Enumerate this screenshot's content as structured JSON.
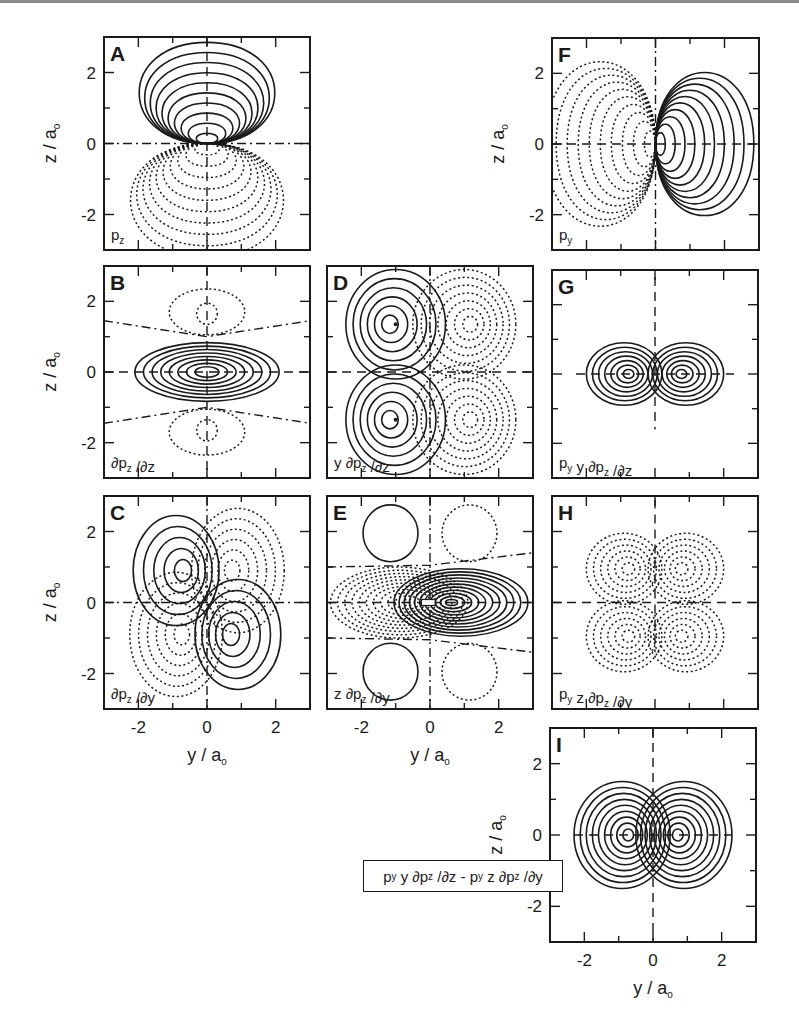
{
  "figure": {
    "axis": {
      "x_title": "y / a",
      "x_title_sub": "o",
      "y_title": "z / a",
      "y_title_sub": "o",
      "x_ticks": [
        "-2",
        "0",
        "2"
      ],
      "y_ticks": [
        "2",
        "0",
        "-2"
      ]
    },
    "panels": [
      {
        "id": "A",
        "label": "A",
        "func": "p",
        "func_sub": "z",
        "func_rest": ""
      },
      {
        "id": "B",
        "label": "B",
        "func": "∂p",
        "func_sub": "z",
        "func_rest": " /∂z"
      },
      {
        "id": "C",
        "label": "C",
        "func": "∂p",
        "func_sub": "z",
        "func_rest": " /∂y"
      },
      {
        "id": "D",
        "label": "D",
        "func": "y ∂p",
        "func_sub": "z",
        "func_rest": " /∂z"
      },
      {
        "id": "E",
        "label": "E",
        "func": "z ∂p",
        "func_sub": "z",
        "func_rest": " /∂y"
      },
      {
        "id": "F",
        "label": "F",
        "func": "p",
        "func_sub": "y",
        "func_rest": ""
      },
      {
        "id": "G",
        "label": "G",
        "func": "p",
        "func_sub": "y",
        "func_rest": " y ∂p",
        "func_sub2": "z",
        "func_rest2": " /∂z"
      },
      {
        "id": "H",
        "label": "H",
        "func": "p",
        "func_sub": "y",
        "func_rest": " z ∂p",
        "func_sub2": "z",
        "func_rest2": " /∂y"
      },
      {
        "id": "I",
        "label": "I"
      }
    ],
    "combined_label": {
      "p1": "p",
      "s1": "y",
      "t1": " y ∂p",
      "s2": "z",
      "t2": " /∂z - p",
      "s3": "y",
      "t3": " z ∂p",
      "s4": "z",
      "t4": " /∂y"
    }
  },
  "chart_data": {
    "type": "heatmap",
    "title": "",
    "xlabel": "y / a_o",
    "ylabel": "z / a_o",
    "xlim": [
      -3,
      3
    ],
    "ylim": [
      -3,
      3
    ],
    "x_ticks": [
      -2,
      0,
      2
    ],
    "y_ticks": [
      -2,
      0,
      2
    ],
    "panels": [
      {
        "id": "A",
        "function": "p_z",
        "positive_lobe_center": [
          0,
          1
        ],
        "negative_lobe_center": [
          0,
          -1
        ]
      },
      {
        "id": "B",
        "function": "∂p_z/∂z",
        "positive_lobe_center": [
          0,
          0
        ],
        "negative_lobe_centers": [
          [
            0,
            1.7
          ],
          [
            0,
            -1.7
          ]
        ]
      },
      {
        "id": "C",
        "function": "∂p_z/∂y",
        "positive_lobe_centers": [
          [
            -0.9,
            0.9
          ],
          [
            0.9,
            -0.9
          ]
        ],
        "negative_lobe_centers": [
          [
            0.9,
            0.9
          ],
          [
            -0.9,
            -0.9
          ]
        ]
      },
      {
        "id": "D",
        "function": "y ∂p_z/∂z",
        "positive_lobe_centers": [
          [
            -1,
            1.3
          ],
          [
            -1,
            -1.3
          ]
        ],
        "negative_lobe_centers": [
          [
            1,
            1.3
          ],
          [
            1,
            -1.3
          ]
        ]
      },
      {
        "id": "E",
        "function": "z ∂p_z/∂y",
        "positive_lobe_centers": [
          [
            0.9,
            0
          ],
          [
            -1.1,
            2
          ],
          [
            -1.1,
            -2
          ]
        ],
        "negative_lobe_centers": [
          [
            -0.9,
            0
          ],
          [
            1.1,
            2
          ],
          [
            1.1,
            -2
          ]
        ]
      },
      {
        "id": "F",
        "function": "p_y",
        "positive_lobe_center": [
          1,
          0
        ],
        "negative_lobe_center": [
          -1,
          0
        ]
      },
      {
        "id": "G",
        "function": "p_y y ∂p_z/∂z",
        "positive_lobe_centers": [
          [
            -0.9,
            0
          ],
          [
            0.9,
            0
          ]
        ]
      },
      {
        "id": "H",
        "function": "p_y z ∂p_z/∂y",
        "negative_lobe_centers": [
          [
            -0.9,
            0.9
          ],
          [
            0.9,
            0.9
          ],
          [
            -0.9,
            -0.9
          ],
          [
            0.9,
            -0.9
          ]
        ]
      },
      {
        "id": "I",
        "function": "p_y y ∂p_z/∂z - p_y z ∂p_z/∂y",
        "positive_lobe_centers": [
          [
            -0.9,
            0
          ],
          [
            0.9,
            0
          ]
        ]
      }
    ]
  }
}
